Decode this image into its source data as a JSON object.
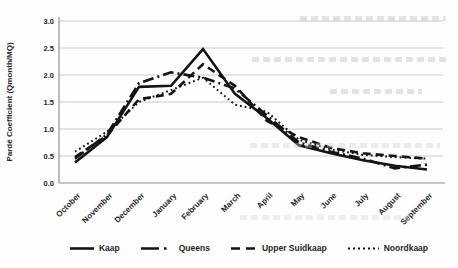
{
  "figure": {
    "background": "#fefefe"
  },
  "chart_data": {
    "type": "line",
    "title": "",
    "xlabel": "",
    "ylabel": "Pardé Coefficient (Qmonth/MQ)",
    "ylim": [
      0,
      3
    ],
    "ytick_step": 0.5,
    "ytick_decimals": 1,
    "grid": true,
    "legend_position": "bottom",
    "categories": [
      "October",
      "November",
      "December",
      "January",
      "February",
      "March",
      "April",
      "May",
      "June",
      "July",
      "August",
      "September"
    ],
    "series": [
      {
        "name": "Kaap",
        "style": "solid",
        "values": [
          0.38,
          0.85,
          1.78,
          1.8,
          2.48,
          1.65,
          1.2,
          0.7,
          0.55,
          0.42,
          0.32,
          0.25
        ]
      },
      {
        "name": "Queens",
        "style": "dashdot",
        "values": [
          0.45,
          0.9,
          1.85,
          2.05,
          1.95,
          1.75,
          1.25,
          0.75,
          0.58,
          0.45,
          0.27,
          0.34
        ]
      },
      {
        "name": "Upper Suidkaap",
        "style": "dashed",
        "values": [
          0.48,
          0.88,
          1.55,
          1.65,
          2.2,
          1.8,
          1.15,
          0.85,
          0.65,
          0.55,
          0.5,
          0.45
        ]
      },
      {
        "name": "Noordkaap",
        "style": "dotted",
        "values": [
          0.58,
          0.95,
          1.5,
          1.72,
          1.95,
          1.45,
          1.32,
          0.8,
          0.62,
          0.52,
          0.48,
          0.45
        ]
      }
    ],
    "colors": {
      "line": "#141414",
      "grid": "#c8c8c8",
      "axis": "#8f8f8f",
      "text": "#262626"
    }
  }
}
